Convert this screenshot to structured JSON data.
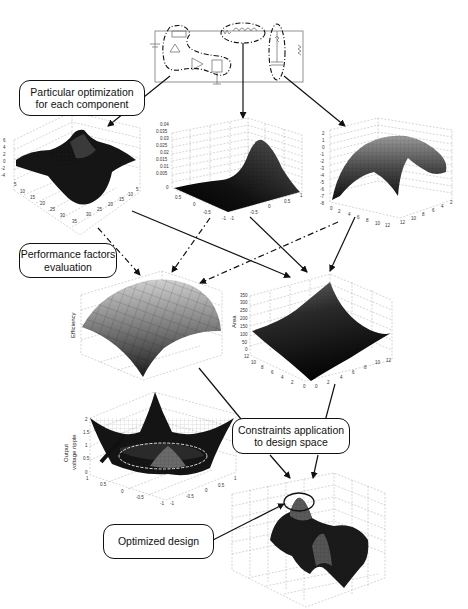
{
  "callouts": {
    "particular_optimization": "Particular optimization for each component",
    "particular_line1": "Particular optimization",
    "particular_line2": "for each component",
    "performance_line1": "Performance factors",
    "performance_line2": "evaluation",
    "constraints_line1": "Constraints application",
    "constraints_line2": "to design space",
    "optimized_design": "Optimized design"
  },
  "plots": {
    "component1": {
      "z_ticks": [
        "6",
        "4",
        "2",
        "0",
        "-2",
        "-4"
      ],
      "x_ticks": [
        "5",
        "10",
        "15",
        "20",
        "25",
        "30",
        "35"
      ],
      "y_ticks": [
        "35",
        "30",
        "25",
        "20",
        "15",
        "10",
        "5"
      ]
    },
    "component2": {
      "z_ticks": [
        "0.04",
        "0.035",
        "0.03",
        "0.025",
        "0.02",
        "0.015",
        "0.01",
        "0.005",
        "0"
      ],
      "x_ticks": [
        "1",
        "0.5",
        "0",
        "-0.5",
        "-1"
      ],
      "y_ticks": [
        "-1",
        "-0.5",
        "0",
        "0.5",
        "1"
      ]
    },
    "component3": {
      "z_ticks": [
        "2",
        "1",
        "0",
        "-1",
        "-2",
        "-3",
        "-4",
        "-5",
        "-6",
        "-7",
        "-8"
      ],
      "x_ticks": [
        "0",
        "2",
        "4",
        "6",
        "8",
        "10",
        "12"
      ],
      "y_ticks": [
        "12",
        "10",
        "8",
        "6",
        "4",
        "2",
        "0"
      ]
    },
    "efficiency": {
      "zlabel": "Efficiency"
    },
    "area": {
      "zlabel": "Area",
      "z_ticks": [
        "350",
        "300",
        "250",
        "200",
        "150",
        "100",
        "50",
        "0"
      ],
      "x_ticks": [
        "12",
        "10",
        "8",
        "6",
        "4",
        "2",
        "0"
      ],
      "y_ticks": [
        "0",
        "2",
        "4",
        "6",
        "8",
        "10",
        "12"
      ]
    },
    "ripple": {
      "zlabel_line1": "Output",
      "zlabel_line2": "voltage ripple",
      "z_ticks": [
        "2",
        "1.5",
        "1",
        "0.5",
        "0"
      ],
      "x_ticks": [
        "1",
        "0.5",
        "0",
        "-0.5",
        "-1"
      ],
      "y_ticks": [
        "-1",
        "-0.5",
        "0",
        "0.5",
        "1"
      ]
    },
    "optimized": {}
  },
  "colors": {
    "surface_dark": "#111111",
    "grid": "#999999",
    "arrow": "#111111"
  }
}
